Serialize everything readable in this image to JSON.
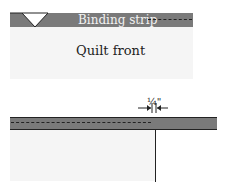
{
  "diagram": {
    "top": {
      "strip_label": "Binding strip",
      "front_label": "Quilt front"
    },
    "bottom": {
      "measurement_label": "¼\""
    },
    "colors": {
      "strip": "#7a7a7a",
      "quilt_front": "#f5f5f5",
      "line": "#222222"
    }
  }
}
